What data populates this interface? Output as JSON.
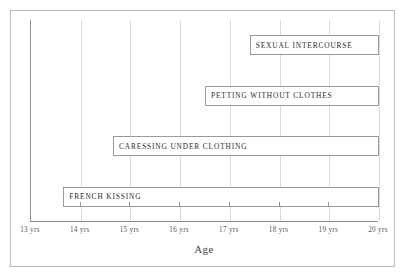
{
  "chart_data": {
    "type": "bar",
    "orientation": "horizontal",
    "title": "",
    "xlabel": "Age",
    "ylabel": "",
    "xlim": [
      13,
      20
    ],
    "grid": true,
    "legend_position": "none",
    "tick_labels": [
      "13 yrs",
      "14 yrs",
      "15 yrs",
      "16 yrs",
      "17 yrs",
      "18 yrs",
      "19 yrs",
      "20 yrs"
    ],
    "tick_values": [
      13,
      14,
      15,
      16,
      17,
      18,
      19,
      20
    ],
    "categories": [
      "SEXUAL INTERCOURSE",
      "PETTING WITHOUT CLOTHES",
      "CARESSING UNDER CLOTHING",
      "FRENCH KISSING"
    ],
    "bars": [
      {
        "label": "SEXUAL INTERCOURSE",
        "start": 17.4,
        "end": 20
      },
      {
        "label": "PETTING WITHOUT CLOTHES",
        "start": 16.5,
        "end": 20
      },
      {
        "label": "CARESSING UNDER CLOTHING",
        "start": 14.65,
        "end": 20
      },
      {
        "label": "FRENCH KISSING",
        "start": 13.65,
        "end": 20
      }
    ],
    "values": [
      2.6,
      3.5,
      5.35,
      6.35
    ],
    "colors": {
      "bar_fill": "#ffffff",
      "bar_stroke": "#9a9a9a",
      "gridline": "#d9d9d9",
      "axis": "#8e8e8e",
      "frame": "#b9b9b9",
      "label_text": "#2b2b2b",
      "tick_text": "#555555",
      "background": "#ffffff"
    }
  }
}
